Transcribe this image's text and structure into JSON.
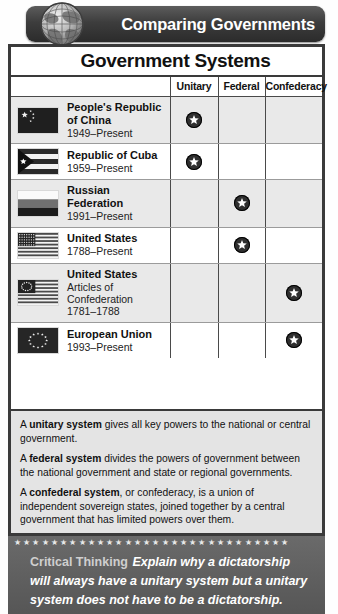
{
  "banner": {
    "title": "Comparing Governments",
    "globe_icon": "globe-icon"
  },
  "table": {
    "title": "Government Systems",
    "columns": [
      "",
      "Unitary",
      "Federal",
      "Confederacy"
    ],
    "rows": [
      {
        "flag": "china-flag",
        "name": "People's Republic of China",
        "sub": "1949–Present",
        "extra": "",
        "unitary": true,
        "federal": false,
        "confederacy": false
      },
      {
        "flag": "cuba-flag",
        "name": "Republic of Cuba",
        "sub": "1959–Present",
        "extra": "",
        "unitary": true,
        "federal": false,
        "confederacy": false
      },
      {
        "flag": "russia-flag",
        "name": "Russian Federation",
        "sub": "1991–Present",
        "extra": "",
        "unitary": false,
        "federal": true,
        "confederacy": false
      },
      {
        "flag": "usa-flag",
        "name": "United States",
        "sub": "1788–Present",
        "extra": "",
        "unitary": false,
        "federal": true,
        "confederacy": false
      },
      {
        "flag": "usa-articles-flag",
        "name": "United States",
        "extra": "Articles of Confederation",
        "sub": "1781–1788",
        "unitary": false,
        "federal": false,
        "confederacy": true
      },
      {
        "flag": "eu-flag",
        "name": "European Union",
        "sub": "1993–Present",
        "extra": "",
        "unitary": false,
        "federal": false,
        "confederacy": true
      }
    ],
    "star_marker_icon": "star-marker-icon"
  },
  "definitions": [
    {
      "term": "A unitary system",
      "bold": "unitary system",
      "lead": "A ",
      "rest": " gives all key powers to the national or central government."
    },
    {
      "term": "A federal system",
      "bold": "federal system",
      "lead": "A ",
      "rest": " divides the powers of government between the national government and state or regional governments."
    },
    {
      "term": "A confederal system",
      "bold": "confederal system",
      "lead": "A ",
      "rest": ", or confederacy, is a union of independent sovereign states, joined together by a central government that has limited powers over them."
    }
  ],
  "critical_thinking": {
    "stars": "★ ★ ★ ★ ★ ★ ★ ★ ★ ★ ★ ★ ★ ★ ★ ★ ★ ★ ★ ★ ★ ★ ★ ★ ★ ★ ★ ★ ★ ★",
    "label": "Critical Thinking",
    "text": "Explain why a dictatorship will always have a unitary system but a unitary system does not have to be a dictatorship."
  },
  "colors": {
    "banner_dark": "#2b2b2b",
    "frame": "#3a3a3a",
    "alt_row": "#e9e9e9",
    "defs_bg": "#e4e4e4",
    "ct_bg": "#5d5d5d"
  }
}
